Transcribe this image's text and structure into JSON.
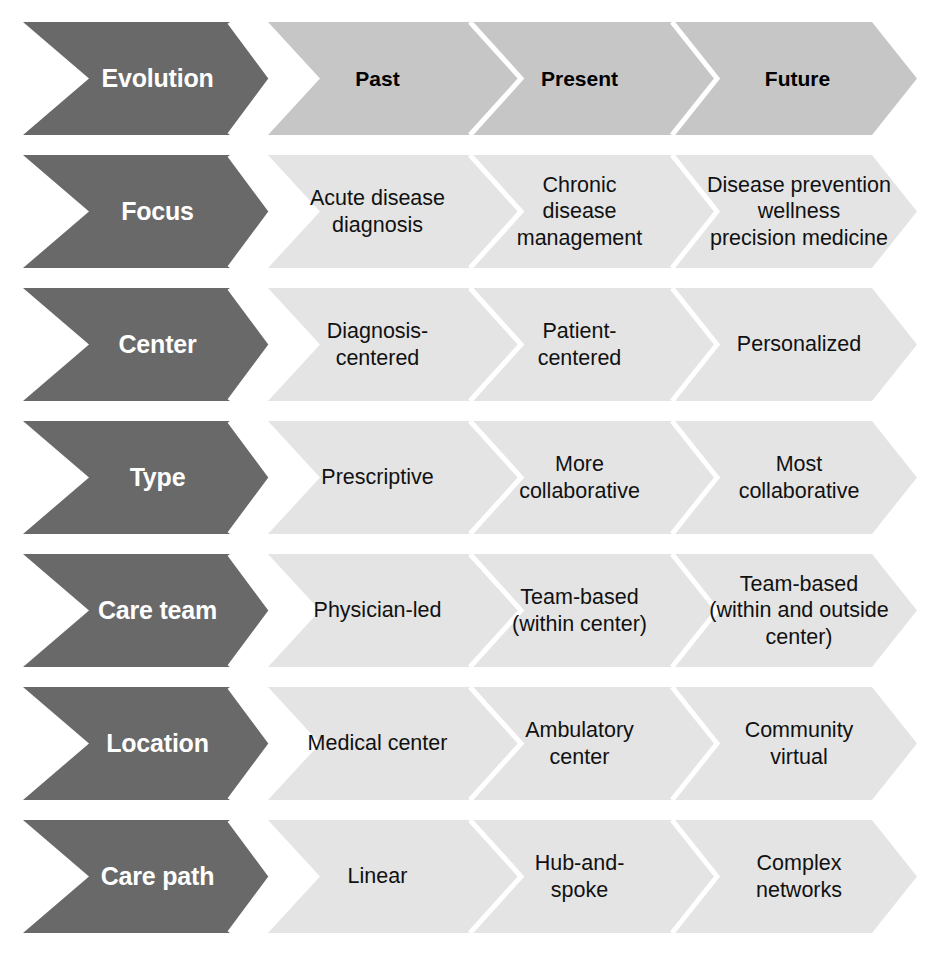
{
  "diagram": {
    "colors": {
      "label_chevron_fill": "#696969",
      "header_cell_fill": "#c6c6c6",
      "body_cell_fill": "#e4e4e4",
      "divider": "#ffffff",
      "label_text": "#ffffff",
      "header_cell_text": "#000000",
      "body_cell_text": "#111111",
      "page_background": "#ffffff"
    },
    "columns": [
      "Past",
      "Present",
      "Future"
    ],
    "header": {
      "label": "Evolution",
      "cells": [
        "Past",
        "Present",
        "Future"
      ]
    },
    "rows": [
      {
        "label": "Focus",
        "cells": [
          "Acute disease\ndiagnosis",
          "Chronic\ndisease\nmanagement",
          "Disease prevention\nwellness\nprecision medicine"
        ]
      },
      {
        "label": "Center",
        "cells": [
          "Diagnosis-\ncentered",
          "Patient-\ncentered",
          "Personalized"
        ]
      },
      {
        "label": "Type",
        "cells": [
          "Prescriptive",
          "More\ncollaborative",
          "Most\ncollaborative"
        ]
      },
      {
        "label": "Care team",
        "cells": [
          "Physician-led",
          "Team-based\n(within center)",
          "Team-based\n(within and outside\ncenter)"
        ]
      },
      {
        "label": "Location",
        "cells": [
          "Medical center",
          "Ambulatory\ncenter",
          "Community\nvirtual"
        ]
      },
      {
        "label": "Care path",
        "cells": [
          "Linear",
          "Hub-and-\nspoke",
          "Complex\nnetworks"
        ]
      }
    ]
  }
}
